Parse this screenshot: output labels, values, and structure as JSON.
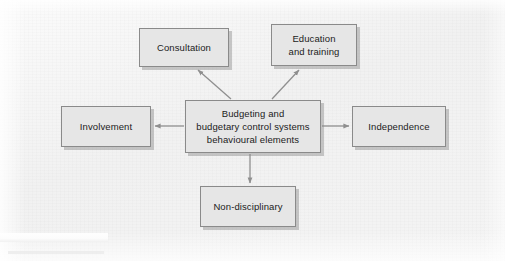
{
  "diagram": {
    "title": "Budgeting and budgetary control systems behavioural elements",
    "background_color": "#f3f3f3",
    "node_fill_color": "#e6e6e6",
    "node_border_color": "#8a8a8a",
    "connector_color": "#8f8f8f",
    "text_color": "#1b1b1b",
    "central_node": {
      "id": "central",
      "label": "Budgeting and\nbudgetary control systems\nbehavioural elements"
    },
    "nodes": [
      {
        "id": "consultation",
        "label": "Consultation"
      },
      {
        "id": "education",
        "label": "Education\nand training"
      },
      {
        "id": "involvement",
        "label": "Involvement"
      },
      {
        "id": "independence",
        "label": "Independence"
      },
      {
        "id": "nondisciplinary",
        "label": "Non-disciplinary"
      }
    ],
    "connectors": [
      {
        "id": "central-to-consultation",
        "from": "central",
        "to": "consultation",
        "direction": "up-left",
        "arrowhead": "at-target"
      },
      {
        "id": "central-to-education",
        "from": "central",
        "to": "education",
        "direction": "up-right",
        "arrowhead": "at-target"
      },
      {
        "id": "central-to-involvement",
        "from": "central",
        "to": "involvement",
        "direction": "left",
        "arrowhead": "at-target"
      },
      {
        "id": "central-to-independence",
        "from": "central",
        "to": "independence",
        "direction": "right",
        "arrowhead": "at-target"
      },
      {
        "id": "central-to-nondisciplinary",
        "from": "central",
        "to": "nondisciplinary",
        "direction": "down",
        "arrowhead": "at-target"
      }
    ]
  }
}
